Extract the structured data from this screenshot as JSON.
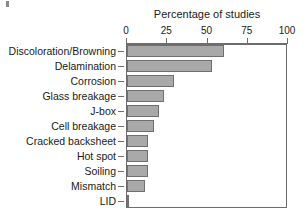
{
  "chart_data": {
    "type": "bar",
    "orientation": "horizontal",
    "title": "Percentage of studies",
    "xlabel": "Percentage of studies",
    "ylabel": "",
    "xlim": [
      0,
      100
    ],
    "xticks": [
      0,
      25,
      50,
      75,
      100
    ],
    "xtick_labels": [
      "0",
      "25",
      "50",
      "75",
      "100"
    ],
    "grid": false,
    "legend": null,
    "axis_position": "top",
    "categories": [
      "Discoloration/Browning",
      "Delamination",
      "Corrosion",
      "Glass breakage",
      "J-box",
      "Cell breakage",
      "Cracked backsheet",
      "Hot spot",
      "Soiling",
      "Mismatch",
      "LID"
    ],
    "values": [
      60,
      53,
      29,
      23,
      20,
      17,
      13,
      13,
      13,
      11,
      1.5
    ]
  },
  "style": {
    "bar_fill": "#a9a9a9",
    "bar_edge": "#6f6f6f",
    "axis_color": "#6d6d6d",
    "text_color": "#1a1a1a",
    "background": "#ffffff"
  }
}
